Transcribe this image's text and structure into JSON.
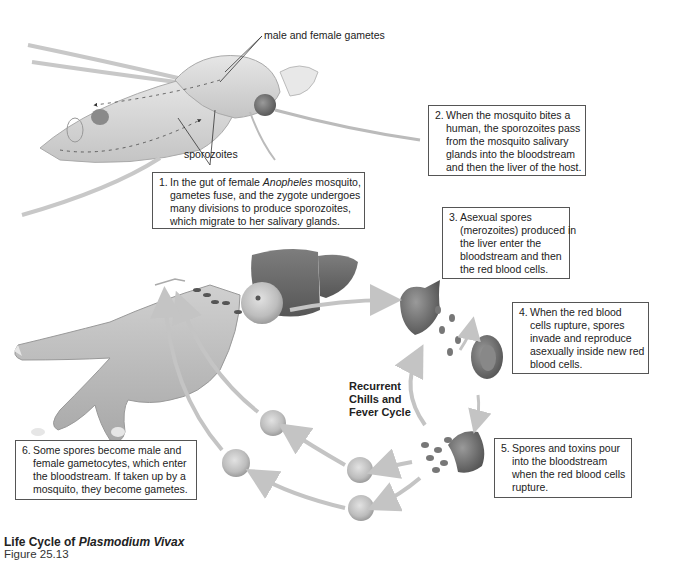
{
  "diagram": {
    "title_prefix": "Life Cycle of",
    "title_species": "Plasmodium Vivax",
    "figure_number": "Figure 25.13",
    "cycle_label": [
      "Recurrent",
      "Chills and",
      "Fever Cycle"
    ],
    "labels": {
      "gametes": "male and female gametes",
      "sporozoites": "sporozoites"
    },
    "steps": [
      {
        "number": "1.",
        "lines": [
          "In the gut of female |Anopheles| mosquito,",
          "gametes fuse, and the zygote undergoes",
          "many divisions to produce sporozoites,",
          "which migrate to her salivary glands."
        ],
        "line_1_pre": "In the gut of female ",
        "line_1_italic": "Anopheles",
        "line_1_post": " mosquito,",
        "line_2": "gametes fuse, and the zygote undergoes",
        "line_3": "many divisions to produce sporozoites,",
        "line_4": "which migrate to her salivary glands."
      },
      {
        "number": "2.",
        "line_1": "When the mosquito bites a",
        "line_2": "human, the sporozoites pass",
        "line_3": "from the mosquito salivary",
        "line_4": "glands into the bloodstream",
        "line_5": "and then the liver of the host."
      },
      {
        "number": "3.",
        "line_1": "Asexual spores",
        "line_2": "(merozoites) produced in",
        "line_3": "the liver enter the",
        "line_4": "bloodstream and then",
        "line_5": "the red blood cells."
      },
      {
        "number": "4.",
        "line_1": "When the red blood",
        "line_2": "cells rupture, spores",
        "line_3": "invade and reproduce",
        "line_4": "asexually inside new red",
        "line_5": "blood cells."
      },
      {
        "number": "5.",
        "line_1": "Spores and toxins pour",
        "line_2": "into the bloodstream",
        "line_3": "when the red blood cells",
        "line_4": "rupture."
      },
      {
        "number": "6.",
        "line_1": "Some spores become male and",
        "line_2": "female gametocytes, which enter",
        "line_3": "the bloodstream. If taken up by a",
        "line_4": "mosquito, they become gametes."
      }
    ],
    "colors": {
      "mosquito": "#c9c9c9",
      "liver": "#6e6e6e",
      "cell": "#b9b9b9",
      "arrow": "#c4c4c4",
      "hand": "#bdbdbd",
      "box_border": "#555555"
    }
  }
}
